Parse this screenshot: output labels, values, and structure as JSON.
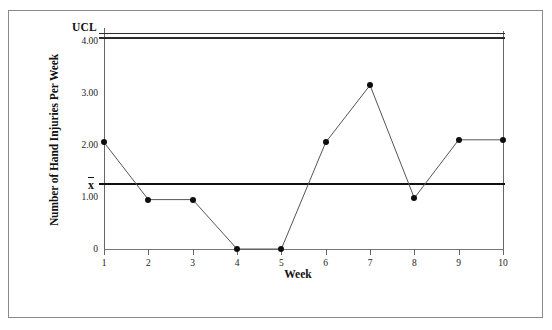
{
  "chart_data": {
    "type": "line",
    "title": "",
    "xlabel": "Week",
    "ylabel": "Number of Hand Injuries Per Week",
    "categories": [
      "1",
      "2",
      "3",
      "4",
      "5",
      "6",
      "7",
      "8",
      "9",
      "10"
    ],
    "x": [
      1,
      2,
      3,
      4,
      5,
      6,
      7,
      8,
      9,
      10
    ],
    "values": [
      2.05,
      0.95,
      0.95,
      0.0,
      0.0,
      2.05,
      3.15,
      0.98,
      2.1,
      2.1
    ],
    "series": [
      {
        "name": "Number of Hand Injuries Per Week",
        "values": [
          2.05,
          0.95,
          0.95,
          0.0,
          0.0,
          2.05,
          3.15,
          0.98,
          2.1,
          2.1
        ]
      }
    ],
    "ylim": [
      0,
      4.25
    ],
    "xlim": [
      1,
      10
    ],
    "ytick_labels": [
      "4.00",
      "3.00",
      "2.00",
      "1.00",
      "0"
    ],
    "ytick_values": [
      4.0,
      3.0,
      2.0,
      1.0,
      0.0
    ],
    "xtick_labels": [
      "1",
      "2",
      "3",
      "4",
      "5",
      "6",
      "7",
      "8",
      "9",
      "10"
    ],
    "grid": false,
    "legend": "none",
    "control_limits": [
      {
        "name": "UCL",
        "label": "UCL",
        "value": 4.12,
        "style": "double-line"
      },
      {
        "name": "center-line",
        "label": "x̄",
        "value": 1.25,
        "style": "solid"
      }
    ],
    "marker": "filled-circle",
    "line_color": "#555555",
    "marker_color": "#0d0d0d",
    "limit_color": "#111111",
    "background_color": "#ffffff"
  },
  "axes": {
    "y_title": "Number of Hand Injuries Per Week",
    "x_title": "Week",
    "y_ticks": [
      {
        "label": "4.00",
        "value": 4.0
      },
      {
        "label": "3.00",
        "value": 3.0
      },
      {
        "label": "2.00",
        "value": 2.0
      },
      {
        "label": "1.00",
        "value": 1.0
      },
      {
        "label": "0",
        "value": 0.0
      }
    ],
    "x_ticks": [
      {
        "label": "1",
        "value": 1
      },
      {
        "label": "2",
        "value": 2
      },
      {
        "label": "3",
        "value": 3
      },
      {
        "label": "4",
        "value": 4
      },
      {
        "label": "5",
        "value": 5
      },
      {
        "label": "6",
        "value": 6
      },
      {
        "label": "7",
        "value": 7
      },
      {
        "label": "8",
        "value": 8
      },
      {
        "label": "9",
        "value": 9
      },
      {
        "label": "10",
        "value": 10
      }
    ]
  },
  "annotations": {
    "ucl_label": "UCL",
    "xbar_label_base": "x",
    "xbar_label_full": "x̄"
  }
}
